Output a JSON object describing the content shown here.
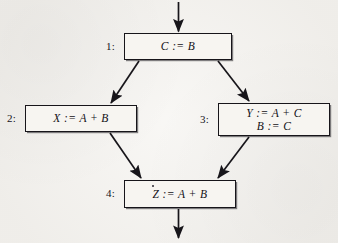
{
  "figure": {
    "type": "control-flow-graph",
    "background_color": "#f4f2ee",
    "ink_color": "#17151a",
    "nodes": [
      {
        "id": "n1",
        "label": "1:",
        "statements": [
          "C := B"
        ]
      },
      {
        "id": "n2",
        "label": "2:",
        "statements": [
          "X := A + B"
        ]
      },
      {
        "id": "n3",
        "label": "3:",
        "statements": [
          "Y := A + C",
          "B := C"
        ]
      },
      {
        "id": "n4",
        "label": "4:",
        "statements": [
          "Z := A + B"
        ]
      }
    ],
    "edges": [
      {
        "name": "entry-arrow",
        "from": "entry",
        "to": "n1"
      },
      {
        "name": "edge-1-to-2",
        "from": "n1",
        "to": "n2"
      },
      {
        "name": "edge-1-to-3",
        "from": "n1",
        "to": "n3"
      },
      {
        "name": "edge-2-to-4",
        "from": "n2",
        "to": "n4"
      },
      {
        "name": "edge-3-to-4",
        "from": "n3",
        "to": "n4"
      },
      {
        "name": "exit-arrow",
        "from": "n4",
        "to": "exit"
      }
    ]
  }
}
